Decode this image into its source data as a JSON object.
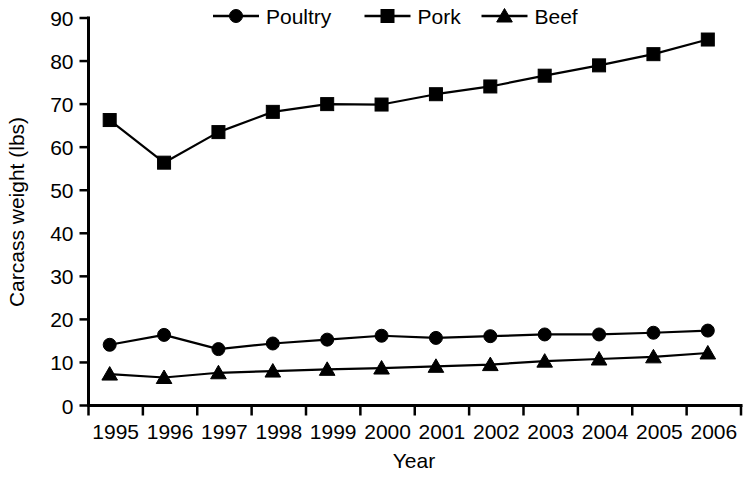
{
  "chart_data": {
    "type": "line",
    "title": "",
    "xlabel": "Year",
    "ylabel": "Carcass weight (lbs)",
    "categories": [
      "1995",
      "1996",
      "1997",
      "1998",
      "1999",
      "2000",
      "2001",
      "2002",
      "2003",
      "2004",
      "2005",
      "2006"
    ],
    "x": [
      1995,
      1996,
      1997,
      1998,
      1999,
      2000,
      2001,
      2002,
      2003,
      2004,
      2005,
      2006
    ],
    "series": [
      {
        "name": "Poultry",
        "marker": "circle",
        "values": [
          14.1,
          16.4,
          13.1,
          14.4,
          15.3,
          16.2,
          15.7,
          16.1,
          16.5,
          16.5,
          16.9,
          17.4
        ]
      },
      {
        "name": "Pork",
        "marker": "square",
        "values": [
          66.3,
          56.4,
          63.5,
          68.2,
          70.0,
          69.9,
          72.3,
          74.1,
          76.6,
          79.0,
          81.6,
          85.0
        ]
      },
      {
        "name": "Beef",
        "marker": "triangle",
        "values": [
          7.3,
          6.5,
          7.6,
          8.0,
          8.4,
          8.7,
          9.1,
          9.5,
          10.3,
          10.8,
          11.3,
          12.2
        ]
      }
    ],
    "ylim": [
      0,
      90
    ],
    "yticks": [
      0,
      10,
      20,
      30,
      40,
      50,
      60,
      70,
      80,
      90
    ],
    "ytick_labels": [
      "0",
      "10",
      "20",
      "30",
      "40",
      "50",
      "60",
      "70",
      "80",
      "90"
    ],
    "grid": false,
    "legend_position": "top",
    "legend": [
      "Poultry",
      "Pork",
      "Beef"
    ],
    "colors": {
      "series": "#000000",
      "axis": "#000000",
      "background": "#ffffff"
    }
  },
  "legend": {
    "items": [
      {
        "label": "Poultry",
        "marker": "circle-marker-icon"
      },
      {
        "label": "Pork",
        "marker": "square-marker-icon"
      },
      {
        "label": "Beef",
        "marker": "triangle-marker-icon"
      }
    ]
  },
  "axes": {
    "y_title": "Carcass weight (lbs)",
    "x_title": "Year",
    "y_ticks": [
      "90",
      "80",
      "70",
      "60",
      "50",
      "40",
      "30",
      "20",
      "10",
      "0"
    ],
    "x_ticks": [
      "1995",
      "1996",
      "1997",
      "1998",
      "1999",
      "2000",
      "2001",
      "2002",
      "2003",
      "2004",
      "2005",
      "2006"
    ]
  }
}
